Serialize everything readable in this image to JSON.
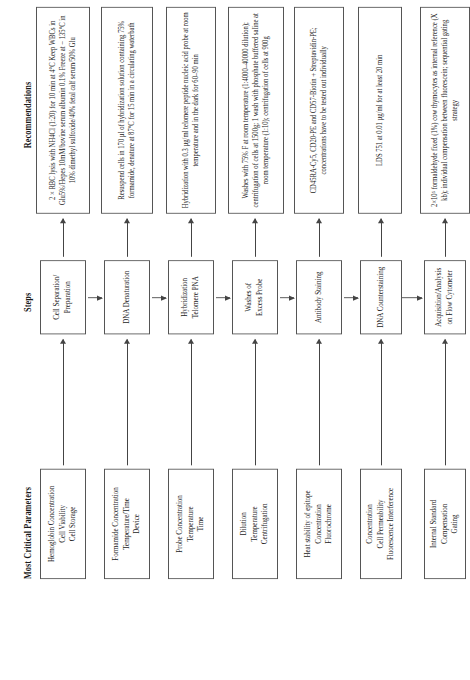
{
  "figure": {
    "headers": {
      "parameters": "Most Critical Parameters",
      "steps": "Steps",
      "recommendations": "Recommendations"
    },
    "rows": [
      {
        "parameters": "Hemoglobin Concentration\nCell Viability\nCell Storage",
        "step": "Cell Separation/\nPreparation",
        "recommendation": "2 × RBC lysis with NH4Cl (1:20) for 10 min at 4°C Keep WBCs in Glu5%/Hepes 10mM/bovine serum albumin 0.1% Freeze at − 135°C in 10% dimethyl sulfoxide/40% fetal calf serum/50% Glu"
      },
      {
        "parameters": "Formamide Concentration\nTemperature/Time\nDevice",
        "step": "DNA Denaturation",
        "recommendation": "Resuspend cells in 170 µl of hybridization solution containing 75% formamide, denature at 87°C for 15 min in a circulating waterbath"
      },
      {
        "parameters": "Probe Concentration\nTemperature\nTime",
        "step": "Hybridization\nTelomere PNA",
        "recommendation": "Hybridization with 0.3 µg/ml telomere peptide nucleic acid probe at room temperature and in the dark for 60–90 min"
      },
      {
        "parameters": "Dilution\nTemperature\nCentrifugation",
        "step": "Washes of\nExcess Probe",
        "recommendation": "Washes with 75% F at room temperature (1:4000–40000 dilution); centrifugation of cells at 1500g; 1 wash with phosphate buffered saline at room temperature (1:10); centrifugation of cells at 900g"
      },
      {
        "parameters": "Heat stability of epitope\nConcentration\nFluorochrome",
        "step": "Antibody Staining",
        "recommendation": "CD45RA-Cy5, CD20-PE and CD57-Biotin + Streptavidin-PE; concentrations have to be tested out individually"
      },
      {
        "parameters": "Concentration\nCell Permeability\nFluorescence Interference",
        "step": "DNA Counterstaining",
        "recommendation": "LDS 751 at 0.01 µg/ml for at least 20 min"
      },
      {
        "parameters": "Internal Standard\nCompensation\nGating",
        "step": "Acquisition/Analysis\non Flow Cytometer",
        "recommendation": "2×10⁵ formaldehyde fixed (1%) cow thymocytes as internal reference (X kb); individual compensation between fluorescein; sequential gating strategy"
      }
    ]
  }
}
